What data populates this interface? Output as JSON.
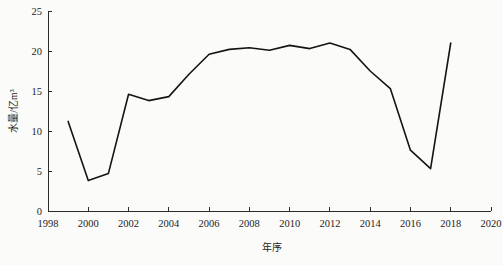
{
  "chart_data": {
    "type": "line",
    "title": "",
    "xlabel": "年序",
    "ylabel": "水量/亿m³",
    "xlim": [
      1998,
      2020
    ],
    "ylim": [
      0,
      25
    ],
    "grid": false,
    "legend": null,
    "x_ticks": [
      "1998",
      "2000",
      "2002",
      "2004",
      "2006",
      "2008",
      "2010",
      "2012",
      "2014",
      "2016",
      "2018",
      "2020"
    ],
    "x_tick_values": [
      1998,
      2000,
      2002,
      2004,
      2006,
      2008,
      2010,
      2012,
      2014,
      2016,
      2018,
      2020
    ],
    "y_ticks": [
      "0",
      "5",
      "10",
      "15",
      "20",
      "25"
    ],
    "y_tick_values": [
      0,
      5,
      10,
      15,
      20,
      25
    ],
    "series": [
      {
        "name": "水量",
        "color": "#141414",
        "x": [
          1999,
          2000,
          2001,
          2002,
          2003,
          2004,
          2005,
          2006,
          2007,
          2008,
          2009,
          2010,
          2011,
          2012,
          2013,
          2014,
          2015,
          2016,
          2017,
          2018
        ],
        "values": [
          11.2,
          3.8,
          4.7,
          14.6,
          13.8,
          14.3,
          17.1,
          19.6,
          20.2,
          20.4,
          20.1,
          20.7,
          20.3,
          21.0,
          20.2,
          17.5,
          15.3,
          7.6,
          5.3,
          21.0
        ]
      }
    ]
  },
  "axes": {
    "y_axis_label": "水量/亿m³",
    "x_axis_label": "年序"
  }
}
